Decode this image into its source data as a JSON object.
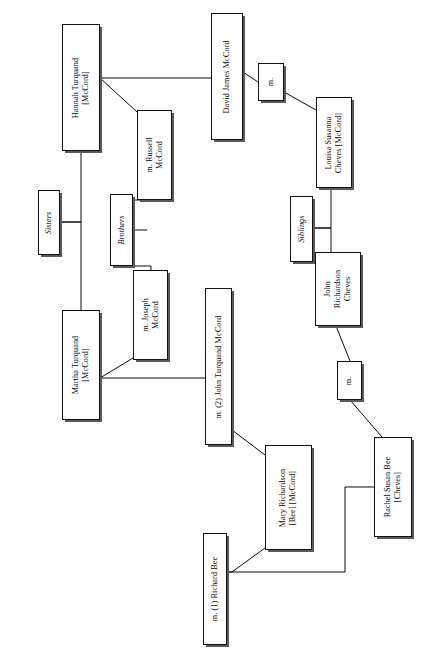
{
  "diagram": {
    "orientation": "rotated-90",
    "ink_color": "#111111",
    "background_color": "#ffffff",
    "shadow_color": "#5a5a5a",
    "nodes": [
      {
        "id": "hannah",
        "label": "Hannah Turquand\n[McCord]",
        "kind": "person",
        "x": 62,
        "y": 24,
        "w": 38,
        "h": 127
      },
      {
        "id": "sisters",
        "label": "Sisters",
        "kind": "group",
        "x": 38,
        "y": 190,
        "w": 22,
        "h": 65
      },
      {
        "id": "brothers",
        "label": "Brothers",
        "kind": "group",
        "x": 110,
        "y": 194,
        "w": 23,
        "h": 72
      },
      {
        "id": "siblings",
        "label": "Siblings",
        "kind": "group",
        "x": 290,
        "y": 196,
        "w": 23,
        "h": 66
      },
      {
        "id": "russell",
        "label": "m. Russell\nMcCord",
        "kind": "person",
        "x": 137,
        "y": 110,
        "w": 35,
        "h": 90
      },
      {
        "id": "joseph",
        "label": "m. Joseph\nMcCord",
        "kind": "person",
        "x": 133,
        "y": 270,
        "w": 35,
        "h": 90
      },
      {
        "id": "martha",
        "label": "Martha Turquand\n[McCord]",
        "kind": "person",
        "x": 62,
        "y": 310,
        "w": 38,
        "h": 110
      },
      {
        "id": "david",
        "label": "David James McCord",
        "kind": "person",
        "x": 211,
        "y": 13,
        "w": 32,
        "h": 127
      },
      {
        "id": "m_top",
        "label": "m.",
        "kind": "marriage",
        "x": 258,
        "y": 63,
        "w": 26,
        "h": 38
      },
      {
        "id": "louisa",
        "label": "Louisa Susanna\nCheves [McCord]",
        "kind": "person",
        "x": 316,
        "y": 97,
        "w": 36,
        "h": 91
      },
      {
        "id": "johnrc",
        "label": "John\nRichardson\nCheves",
        "kind": "person",
        "x": 315,
        "y": 252,
        "w": 46,
        "h": 74
      },
      {
        "id": "m_bot",
        "label": "m.",
        "kind": "marriage",
        "x": 337,
        "y": 361,
        "w": 25,
        "h": 39
      },
      {
        "id": "john2",
        "label": "m. (2) John Turquand McCord",
        "kind": "person",
        "x": 205,
        "y": 288,
        "w": 27,
        "h": 157
      },
      {
        "id": "mary",
        "label": "Mary Richardson\n[Bee] [McCord]",
        "kind": "person",
        "x": 265,
        "y": 445,
        "w": 47,
        "h": 105
      },
      {
        "id": "rachel",
        "label": "Rachel Susan Bee\n[Cheves]",
        "kind": "person",
        "x": 374,
        "y": 437,
        "w": 38,
        "h": 100
      },
      {
        "id": "richard",
        "label": "m. (1) Richard Bee",
        "kind": "person",
        "x": 203,
        "y": 533,
        "w": 24,
        "h": 112
      }
    ],
    "connectors": [
      {
        "id": "hannah-to-david",
        "points": "100,78 211,78"
      },
      {
        "id": "hannah-to-russell",
        "points": "100,78 137,112"
      },
      {
        "id": "hannah-to-sisters",
        "points": "60,222 81,222 81,151"
      },
      {
        "id": "sisters-to-martha",
        "points": "60,222 81,222 81,310"
      },
      {
        "id": "russell-to-brothers",
        "points": "133,200 147,200"
      },
      {
        "id": "brothers-spine",
        "points": "110,230 147,230"
      },
      {
        "id": "brothers-to-joseph",
        "points": "133,266 151,266 151,270"
      },
      {
        "id": "martha-to-joseph",
        "points": "100,378 133,358"
      },
      {
        "id": "martha-to-john2",
        "points": "100,378 205,378"
      },
      {
        "id": "david-to-m-top",
        "points": "243,72 258,82"
      },
      {
        "id": "m-top-to-louisa",
        "points": "284,92 316,110"
      },
      {
        "id": "louisa-to-siblings",
        "points": "313,228 331,228 331,188"
      },
      {
        "id": "siblings-to-johnrc",
        "points": "313,228 331,228 331,252"
      },
      {
        "id": "johnrc-to-m-bot",
        "points": "336,326 350,361"
      },
      {
        "id": "m-bot-to-rachel",
        "points": "350,400 382,437"
      },
      {
        "id": "john2-to-mary",
        "points": "232,430 265,455"
      },
      {
        "id": "mary-to-richard",
        "points": "265,548 232,572 227,572"
      },
      {
        "id": "richard-to-rachel",
        "points": "227,572 345,572 345,487 374,487"
      }
    ]
  }
}
